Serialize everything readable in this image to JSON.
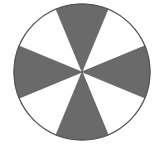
{
  "diagram": {
    "type": "sector-circle",
    "sectors_total": 8,
    "shaded_sectors": 4,
    "sector_angle_deg": 45,
    "shaded_centers_deg": [
      0,
      90,
      180,
      270
    ],
    "colors": {
      "shaded": "#6a6a6a",
      "unshaded": "#ffffff",
      "outline": "#555555"
    },
    "geometry": {
      "cx": 82,
      "cy": 72,
      "r": 68
    }
  }
}
